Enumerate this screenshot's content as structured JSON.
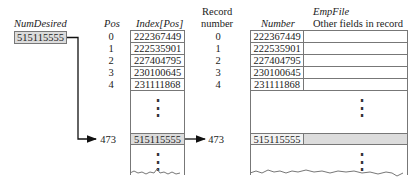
{
  "num_desired": {
    "label": "NumDesired",
    "value": "515115555"
  },
  "pos": {
    "label": "Pos",
    "values": [
      "0",
      "1",
      "2",
      "3",
      "4"
    ],
    "target": "473"
  },
  "index": {
    "label": "Index[Pos]",
    "values": [
      "222367449",
      "222535901",
      "227404795",
      "230100645",
      "231111868"
    ],
    "target_value": "515115555"
  },
  "record": {
    "label_line1": "Record",
    "label_line2": "number",
    "values": [
      "0",
      "1",
      "2",
      "3",
      "4"
    ],
    "target": "473"
  },
  "empfile": {
    "title": "EmpFile",
    "number_label": "Number",
    "other_label": "Other fields in record",
    "values": [
      "222367449",
      "222535901",
      "227404795",
      "230100645",
      "231111868"
    ],
    "target_value": "515115555"
  },
  "ellipsis": "⋮",
  "colors": {
    "highlight": "#dcdcdc",
    "border": "#777777",
    "arrow": "#111111"
  }
}
